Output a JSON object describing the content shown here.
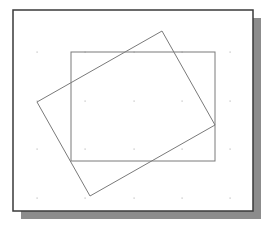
{
  "diagram": {
    "colors": {
      "background": "#ffffff",
      "frame_border": "#3a3a3a",
      "shadow": "#8c8c8c",
      "shape_stroke": "#7a7a7a",
      "grid_dot": "#bdbdbd"
    },
    "frame": {
      "x": 13,
      "y": 10,
      "width": 240,
      "height": 201,
      "shadow_offset": 8
    },
    "grid": {
      "xs": [
        37,
        85,
        134,
        182,
        230
      ],
      "ys": [
        52,
        101,
        149,
        198
      ]
    },
    "shapes": [
      {
        "name": "axis-aligned-rectangle",
        "type": "rect",
        "x": 71,
        "y": 52,
        "width": 144,
        "height": 109
      },
      {
        "name": "rotated-rectangle",
        "type": "polygon",
        "points": [
          [
            162,
            31
          ],
          [
            215,
            125
          ],
          [
            90,
            196
          ],
          [
            37,
            102
          ]
        ]
      }
    ]
  }
}
